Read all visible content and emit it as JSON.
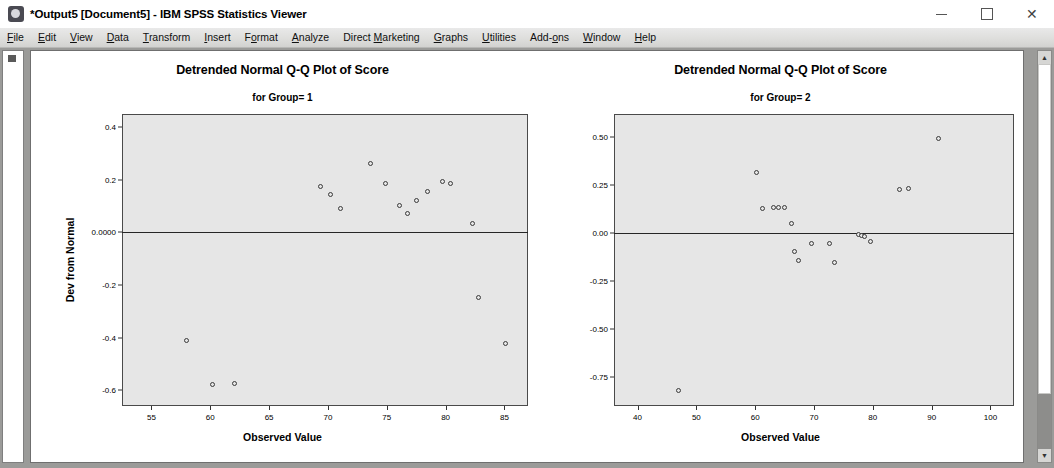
{
  "window": {
    "title": "*Output5 [Document5] - IBM SPSS Statistics Viewer",
    "app_icon": "spss-viewer-icon",
    "controls": {
      "minimize": "minimize-icon",
      "maximize": "maximize-icon",
      "close": "close-icon"
    }
  },
  "menubar": {
    "items": [
      {
        "label": "File",
        "mnemonic": "F"
      },
      {
        "label": "Edit",
        "mnemonic": "E"
      },
      {
        "label": "View",
        "mnemonic": "V"
      },
      {
        "label": "Data",
        "mnemonic": "D"
      },
      {
        "label": "Transform",
        "mnemonic": "T"
      },
      {
        "label": "Insert",
        "mnemonic": "I"
      },
      {
        "label": "Format",
        "mnemonic": "o"
      },
      {
        "label": "Analyze",
        "mnemonic": "A"
      },
      {
        "label": "Direct Marketing",
        "mnemonic": "M"
      },
      {
        "label": "Graphs",
        "mnemonic": "G"
      },
      {
        "label": "Utilities",
        "mnemonic": "U"
      },
      {
        "label": "Add-ons",
        "mnemonic": "o"
      },
      {
        "label": "Window",
        "mnemonic": "W"
      },
      {
        "label": "Help",
        "mnemonic": "H"
      }
    ]
  },
  "outline_pane": {
    "node_icon": "output-node-icon"
  },
  "scrollbar": {
    "up_arrow": "▲",
    "down_arrow": "▼"
  },
  "colors": {
    "plot_background": "#e6e6e6",
    "plot_border": "#4a4a4a",
    "marker_stroke": "#3a3a3a",
    "zero_line": "#262626",
    "menubar_background": "#dededc"
  },
  "chart_data": [
    {
      "type": "scatter",
      "id": "group-1",
      "title": "Detrended Normal Q-Q Plot of Score",
      "subtitle": "for Group= 1",
      "xlabel": "Observed Value",
      "ylabel": "Dev from Normal",
      "xlim": [
        52.5,
        87.0
      ],
      "ylim": [
        -0.66,
        0.45
      ],
      "xticks": [
        55,
        60,
        65,
        70,
        75,
        80,
        85
      ],
      "xtick_labels": [
        "55",
        "60",
        "65",
        "70",
        "75",
        "80",
        "85"
      ],
      "yticks": [
        0.4,
        0.2,
        0.0,
        -0.2,
        -0.4,
        -0.6
      ],
      "ytick_labels": [
        "0.4",
        "0.2",
        "0.0000",
        "-0.2",
        "-0.4",
        "-0.6"
      ],
      "reference_line": 0.0,
      "grid": false,
      "legend": null,
      "points": [
        {
          "x": 58.0,
          "y": -0.41
        },
        {
          "x": 60.2,
          "y": -0.578
        },
        {
          "x": 62.1,
          "y": -0.575
        },
        {
          "x": 69.4,
          "y": 0.175
        },
        {
          "x": 70.2,
          "y": 0.143
        },
        {
          "x": 71.1,
          "y": 0.09
        },
        {
          "x": 73.6,
          "y": 0.262
        },
        {
          "x": 74.9,
          "y": 0.186
        },
        {
          "x": 76.1,
          "y": 0.104
        },
        {
          "x": 76.8,
          "y": 0.073
        },
        {
          "x": 77.5,
          "y": 0.122
        },
        {
          "x": 78.5,
          "y": 0.156
        },
        {
          "x": 79.7,
          "y": 0.192
        },
        {
          "x": 80.4,
          "y": 0.186
        },
        {
          "x": 82.3,
          "y": 0.032
        },
        {
          "x": 82.8,
          "y": -0.248
        },
        {
          "x": 85.1,
          "y": -0.423
        }
      ]
    },
    {
      "type": "scatter",
      "id": "group-2",
      "title": "Detrended Normal Q-Q Plot of Score",
      "subtitle": "for Group= 2",
      "xlabel": "Observed Value",
      "ylabel": "Dev from Normal",
      "xlim": [
        36.0,
        104.0
      ],
      "ylim": [
        -0.9,
        0.62
      ],
      "xticks": [
        40,
        50,
        60,
        70,
        80,
        90,
        100
      ],
      "xtick_labels": [
        "40",
        "50",
        "60",
        "70",
        "80",
        "90",
        "100"
      ],
      "yticks": [
        0.5,
        0.25,
        0.0,
        -0.25,
        -0.5,
        -0.75
      ],
      "ytick_labels": [
        "0.50",
        "0.25",
        "0.00",
        "-0.25",
        "-0.50",
        "-0.75"
      ],
      "reference_line": 0.0,
      "grid": false,
      "legend": null,
      "points": [
        {
          "x": 47.0,
          "y": -0.82
        },
        {
          "x": 60.3,
          "y": 0.315
        },
        {
          "x": 61.2,
          "y": 0.13
        },
        {
          "x": 63.1,
          "y": 0.135
        },
        {
          "x": 64.0,
          "y": 0.133
        },
        {
          "x": 64.9,
          "y": 0.131
        },
        {
          "x": 66.1,
          "y": 0.052
        },
        {
          "x": 66.6,
          "y": -0.095
        },
        {
          "x": 67.4,
          "y": -0.143
        },
        {
          "x": 69.6,
          "y": -0.055
        },
        {
          "x": 72.6,
          "y": -0.053
        },
        {
          "x": 73.4,
          "y": -0.155
        },
        {
          "x": 77.6,
          "y": -0.007
        },
        {
          "x": 78.1,
          "y": -0.01
        },
        {
          "x": 78.6,
          "y": -0.02
        },
        {
          "x": 79.6,
          "y": -0.043
        },
        {
          "x": 84.6,
          "y": 0.228
        },
        {
          "x": 86.1,
          "y": 0.23
        },
        {
          "x": 91.2,
          "y": 0.492
        }
      ]
    }
  ]
}
